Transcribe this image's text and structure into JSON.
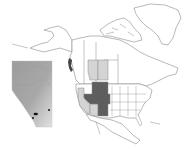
{
  "map": {
    "type": "distribution-map",
    "region": "North America",
    "inset": {
      "region": "Alberta",
      "shading": "relief-grayscale",
      "occurrence_points": [
        {
          "x": 35,
          "y": 114
        },
        {
          "x": 36,
          "y": 114
        },
        {
          "x": 33,
          "y": 118
        },
        {
          "x": 49,
          "y": 110
        }
      ]
    },
    "highlighted_regions": {
      "dark": [
        "Montana",
        "Wyoming",
        "Nevada",
        "Utah",
        "Colorado",
        "New Mexico (NE)"
      ],
      "light": [
        "Alberta",
        "Saskatchewan",
        "California",
        "Arizona"
      ]
    },
    "colors": {
      "dark_fill": "#5e5e5e",
      "light_fill": "#d4d4d4",
      "outline": "#8a8a8a",
      "background": "#ffffff",
      "point": "#111111"
    }
  }
}
